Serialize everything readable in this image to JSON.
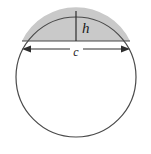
{
  "figure": {
    "background_color": "#ffffff",
    "stroke_color": "#4a4a4a",
    "segment_fill_color": "#c9c9c9",
    "label_color": "#1a1a1a"
  },
  "circle": {
    "name": "circle-outline",
    "center_x": 76,
    "center_y": 77,
    "radius": 60
  },
  "segment": {
    "name": "shaded-circular-segment",
    "fill": "#c9c9c9",
    "chord_y": 41,
    "chord_left_x": 22,
    "chord_right_x": 130
  },
  "labels": {
    "height": {
      "text": "h",
      "x": 82,
      "y": 30
    },
    "chord": {
      "text": "c",
      "x": 76,
      "y": 53
    }
  },
  "height_line": {
    "name": "height-measure-line",
    "x": 76,
    "y_top": 11,
    "y_bottom": 41
  },
  "chord_arrow": {
    "name": "chord-measure-arrow",
    "y": 49,
    "x_start": 22,
    "x_end": 130,
    "arrowheads": "both"
  }
}
